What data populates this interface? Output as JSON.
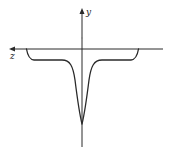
{
  "diagram": {
    "type": "potential-well-curve",
    "axes": {
      "horizontal": {
        "label": "z",
        "direction": "left"
      },
      "vertical": {
        "label": "y",
        "direction": "up"
      }
    },
    "colors": {
      "stroke": "#2a2a2a",
      "background": "#ffffff"
    }
  }
}
